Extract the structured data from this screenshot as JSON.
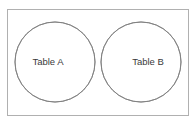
{
  "figure": {
    "width": 196,
    "height": 124,
    "background_color": "#ffffff"
  },
  "frame": {
    "name": "outer-border",
    "stroke_color": "#b0b0b0",
    "x": 7,
    "y": 9,
    "width": 182,
    "height": 107
  },
  "sets": {
    "left": {
      "label": "Table A",
      "fill_color": "#ffffff",
      "stroke_color": "#808080",
      "center_x": 55,
      "center_y": 62,
      "radius": 40,
      "label_x": 48,
      "label_y": 62
    },
    "right": {
      "label": "Table B",
      "fill_color": "#ffffff",
      "stroke_color": "#808080",
      "center_x": 141,
      "center_y": 62,
      "radius": 40,
      "label_x": 148,
      "label_y": 62
    }
  },
  "intersection": {
    "name": "overlap-region",
    "fill_color": "#d2d2d2",
    "stroke_color": "#808080",
    "top_x": 98,
    "top_y": 32,
    "bottom_x": 98,
    "bottom_y": 91
  },
  "text_color": "#3a3a3a"
}
